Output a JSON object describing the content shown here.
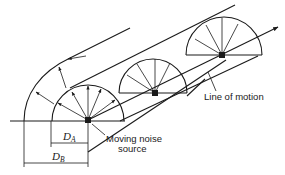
{
  "figure": {
    "type": "line-drawing",
    "labels": {
      "line_of_motion": "Line of motion",
      "source_line1": "Moving noise",
      "source_line2": "source",
      "d_a": "D",
      "d_a_sub": "A",
      "d_b": "D",
      "d_b_sub": "B"
    },
    "elements": {
      "hemispheres": [
        {
          "name": "hemisphere-1",
          "center": [
            88,
            120
          ],
          "radius": 32,
          "rays": "arrows"
        },
        {
          "name": "hemisphere-2",
          "center": [
            155,
            96
          ],
          "radius": 32,
          "rays": "lines"
        },
        {
          "name": "hemisphere-3",
          "center": [
            222,
            52
          ],
          "radius": 38,
          "rays": "lines"
        }
      ],
      "dimensions": [
        "D_A",
        "D_B"
      ]
    },
    "colors": {
      "stroke": "#1a1a1a",
      "background": "#ffffff"
    }
  }
}
